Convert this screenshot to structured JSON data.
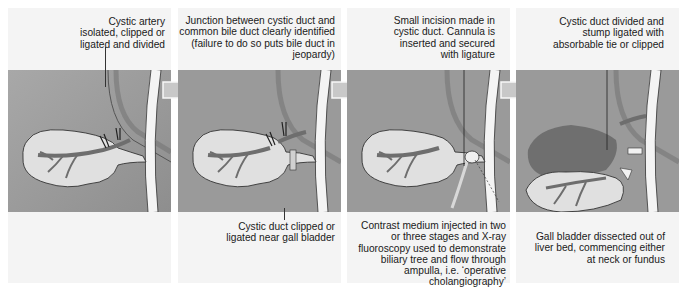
{
  "figure": {
    "title": "",
    "panels": [
      {
        "id": 1,
        "top_caption": "Cystic artery\nisolated, clipped or\nligated and divided",
        "bottom_caption": ""
      },
      {
        "id": 2,
        "top_caption": "Junction between cystic duct and\ncommon bile duct clearly identified\n(failure to do so puts bile duct in\njeopardy)",
        "bottom_caption": "Cystic duct clipped or\nligated near gall bladder"
      },
      {
        "id": 3,
        "top_caption": "Small incision made in\ncystic duct. Cannula is\ninserted and secured\nwith ligature",
        "bottom_caption": "Contrast medium injected in two\nor three stages and X-ray\nfluoroscopy used to demonstrate\nbiliary tree and flow through\nampulla, i.e. ‘operative\ncholangiography’"
      },
      {
        "id": 4,
        "top_caption": "Cystic duct divided and\nstump ligated with\nabsorbable tie or clipped",
        "bottom_caption": "Gall bladder dissected out of\nliver bed, commencing either\nat neck or fundus"
      }
    ],
    "arrows": [
      "step-arrow-1-2",
      "step-arrow-2-3",
      "step-arrow-3-4"
    ],
    "colors": {
      "panel_background": "#f4f4f4",
      "scene_background": "#9a9a9a",
      "gall_bladder_fill": "#dcdcdc",
      "duct_fill": "#f2f2f2",
      "artery_fill": "#7a7a7a",
      "liver_bed": "#6a6a6a",
      "arrow_fill": "#c8c8c8"
    }
  }
}
